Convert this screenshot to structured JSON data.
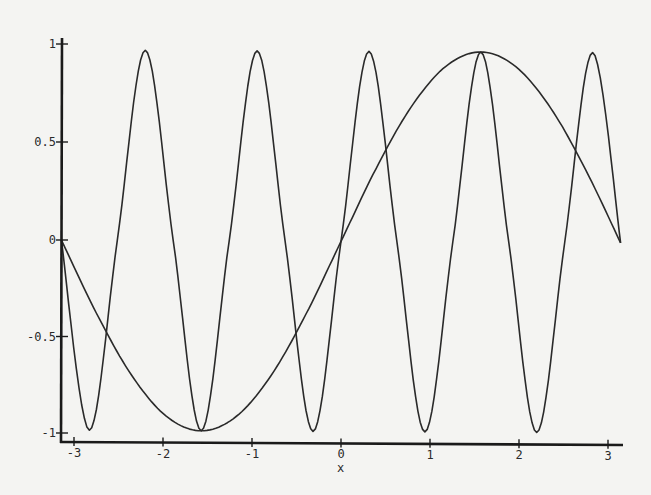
{
  "chart_data": {
    "type": "line",
    "title": "",
    "xlabel": "x",
    "ylabel": "",
    "xlim": [
      -3.14159,
      3.14159
    ],
    "ylim": [
      -1,
      1
    ],
    "grid": false,
    "legend": null,
    "x_ticks": [
      -3,
      -2,
      -1,
      0,
      1,
      2,
      3
    ],
    "x_tick_labels": [
      "-3",
      "-2",
      "-1",
      "0",
      "1",
      "2",
      "3"
    ],
    "y_ticks": [
      -1,
      -0.5,
      0,
      0.5,
      1
    ],
    "y_tick_labels": [
      "-1",
      "-0.5",
      "0",
      "0.5",
      "1"
    ],
    "series": [
      {
        "name": "sin(x)",
        "x": [
          -3.1416,
          -2.7489,
          -2.3562,
          -1.9635,
          -1.5708,
          -1.1781,
          -0.7854,
          -0.3927,
          0,
          0.3927,
          0.7854,
          1.1781,
          1.5708,
          1.9635,
          2.3562,
          2.7489,
          3.1416
        ],
        "values": [
          0,
          -0.383,
          -0.707,
          -0.924,
          -1,
          -0.924,
          -0.707,
          -0.383,
          0,
          0.383,
          0.707,
          0.924,
          1,
          0.924,
          0.707,
          0.383,
          0
        ]
      },
      {
        "name": "sin(5x)",
        "x": [
          -3.1416,
          -2.8274,
          -2.5133,
          -2.1991,
          -1.885,
          -1.5708,
          -1.2566,
          -0.9425,
          -0.6283,
          -0.3142,
          0,
          0.3142,
          0.6283,
          0.9425,
          1.2566,
          1.5708,
          1.885,
          2.1991,
          2.5133,
          2.8274,
          3.1416
        ],
        "values": [
          0,
          -1,
          0,
          1,
          0,
          -1,
          0,
          1,
          0,
          -1,
          0,
          1,
          0,
          -1,
          0,
          1,
          0,
          -1,
          0,
          1,
          0
        ]
      }
    ]
  },
  "plot": {
    "x_axis_label": "x",
    "line_color": "#2a2a2a",
    "axis_color": "#1a1a1a",
    "background": "#f4f4f2"
  }
}
